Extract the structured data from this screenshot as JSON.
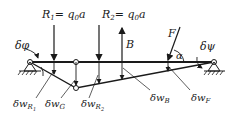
{
  "diagram": {
    "loads": {
      "R1": {
        "label": "R",
        "subscript": "1",
        "expr": "= q",
        "expr_sub": "0",
        "expr_tail": "a"
      },
      "R2": {
        "label": "R",
        "subscript": "2",
        "expr": "= q",
        "expr_sub": "0",
        "expr_tail": "a"
      },
      "B": {
        "label": "B"
      },
      "F": {
        "label": "F"
      }
    },
    "angles": {
      "alpha": "α",
      "delta_phi": "δφ",
      "delta_psi": "δψ"
    },
    "displacements": [
      {
        "id": "wR1",
        "delta": "δw",
        "sub": "R",
        "subsub": "1"
      },
      {
        "id": "wG",
        "delta": "δw",
        "sub": "G",
        "subsub": ""
      },
      {
        "id": "wR2",
        "delta": "δw",
        "sub": "R",
        "subsub": "2"
      },
      {
        "id": "wB",
        "delta": "δw",
        "sub": "B",
        "subsub": ""
      },
      {
        "id": "wF",
        "delta": "δw",
        "sub": "F",
        "subsub": ""
      }
    ]
  }
}
